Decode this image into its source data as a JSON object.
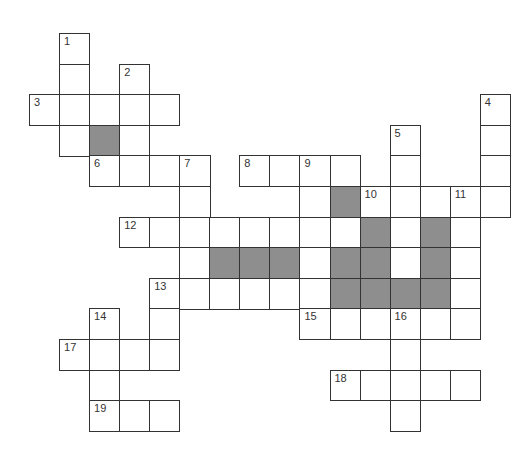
{
  "puzzle": {
    "type": "crossword",
    "cell_size": 30.2,
    "origin_x": 29,
    "origin_y": 33,
    "colors": {
      "line": "#333333",
      "blank": "#ffffff",
      "shade": "#8e8e8e"
    },
    "cells": [
      {
        "r": 0,
        "c": 1,
        "n": "1"
      },
      {
        "r": 1,
        "c": 1
      },
      {
        "r": 1,
        "c": 3,
        "n": "2"
      },
      {
        "r": 2,
        "c": 0,
        "n": "3"
      },
      {
        "r": 2,
        "c": 1
      },
      {
        "r": 2,
        "c": 2
      },
      {
        "r": 2,
        "c": 3
      },
      {
        "r": 2,
        "c": 4
      },
      {
        "r": 2,
        "c": 15,
        "n": "4"
      },
      {
        "r": 3,
        "c": 1
      },
      {
        "r": 3,
        "c": 2,
        "shade": true
      },
      {
        "r": 3,
        "c": 3
      },
      {
        "r": 3,
        "c": 12,
        "n": "5"
      },
      {
        "r": 3,
        "c": 15
      },
      {
        "r": 4,
        "c": 2,
        "n": "6"
      },
      {
        "r": 4,
        "c": 3
      },
      {
        "r": 4,
        "c": 4
      },
      {
        "r": 4,
        "c": 5,
        "n": "7"
      },
      {
        "r": 4,
        "c": 7,
        "n": "8"
      },
      {
        "r": 4,
        "c": 8
      },
      {
        "r": 4,
        "c": 9,
        "n": "9"
      },
      {
        "r": 4,
        "c": 10
      },
      {
        "r": 4,
        "c": 12
      },
      {
        "r": 4,
        "c": 15
      },
      {
        "r": 5,
        "c": 5
      },
      {
        "r": 5,
        "c": 9
      },
      {
        "r": 5,
        "c": 10,
        "shade": true
      },
      {
        "r": 5,
        "c": 11,
        "n": "10"
      },
      {
        "r": 5,
        "c": 12
      },
      {
        "r": 5,
        "c": 13
      },
      {
        "r": 5,
        "c": 14,
        "n": "11"
      },
      {
        "r": 5,
        "c": 15
      },
      {
        "r": 6,
        "c": 3,
        "n": "12"
      },
      {
        "r": 6,
        "c": 4
      },
      {
        "r": 6,
        "c": 5
      },
      {
        "r": 6,
        "c": 6
      },
      {
        "r": 6,
        "c": 7
      },
      {
        "r": 6,
        "c": 8
      },
      {
        "r": 6,
        "c": 9
      },
      {
        "r": 6,
        "c": 10
      },
      {
        "r": 6,
        "c": 11,
        "shade": true
      },
      {
        "r": 6,
        "c": 12
      },
      {
        "r": 6,
        "c": 13,
        "shade": true
      },
      {
        "r": 6,
        "c": 14
      },
      {
        "r": 7,
        "c": 5
      },
      {
        "r": 7,
        "c": 6,
        "shade": true
      },
      {
        "r": 7,
        "c": 7,
        "shade": true
      },
      {
        "r": 7,
        "c": 8,
        "shade": true
      },
      {
        "r": 7,
        "c": 9
      },
      {
        "r": 7,
        "c": 10,
        "shade": true
      },
      {
        "r": 7,
        "c": 11,
        "shade": true
      },
      {
        "r": 7,
        "c": 12
      },
      {
        "r": 7,
        "c": 13,
        "shade": true
      },
      {
        "r": 7,
        "c": 14
      },
      {
        "r": 8,
        "c": 4,
        "n": "13"
      },
      {
        "r": 8,
        "c": 5
      },
      {
        "r": 8,
        "c": 6
      },
      {
        "r": 8,
        "c": 7
      },
      {
        "r": 8,
        "c": 8
      },
      {
        "r": 8,
        "c": 9
      },
      {
        "r": 8,
        "c": 10,
        "shade": true
      },
      {
        "r": 8,
        "c": 11,
        "shade": true
      },
      {
        "r": 8,
        "c": 12,
        "shade": true
      },
      {
        "r": 8,
        "c": 13,
        "shade": true
      },
      {
        "r": 8,
        "c": 14
      },
      {
        "r": 9,
        "c": 2,
        "n": "14"
      },
      {
        "r": 9,
        "c": 4
      },
      {
        "r": 9,
        "c": 9,
        "n": "15"
      },
      {
        "r": 9,
        "c": 10
      },
      {
        "r": 9,
        "c": 11
      },
      {
        "r": 9,
        "c": 12,
        "n": "16"
      },
      {
        "r": 9,
        "c": 13
      },
      {
        "r": 9,
        "c": 14
      },
      {
        "r": 10,
        "c": 1,
        "n": "17"
      },
      {
        "r": 10,
        "c": 2
      },
      {
        "r": 10,
        "c": 3
      },
      {
        "r": 10,
        "c": 4
      },
      {
        "r": 10,
        "c": 12
      },
      {
        "r": 11,
        "c": 2
      },
      {
        "r": 11,
        "c": 10,
        "n": "18"
      },
      {
        "r": 11,
        "c": 11
      },
      {
        "r": 11,
        "c": 12
      },
      {
        "r": 11,
        "c": 13
      },
      {
        "r": 11,
        "c": 14
      },
      {
        "r": 12,
        "c": 2,
        "n": "19"
      },
      {
        "r": 12,
        "c": 3
      },
      {
        "r": 12,
        "c": 4
      },
      {
        "r": 12,
        "c": 12
      }
    ]
  }
}
